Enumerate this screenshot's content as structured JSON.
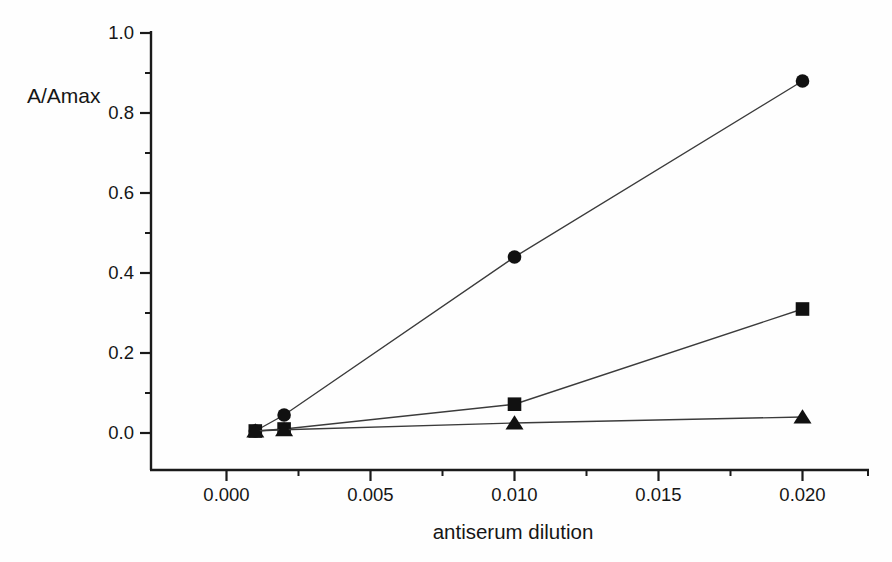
{
  "chart_data": {
    "type": "line",
    "title": "",
    "xlabel": "antiserum dilution",
    "ylabel": "A/Amax",
    "xlim": [
      -0.0026,
      0.0223
    ],
    "ylim": [
      -0.093,
      1.0
    ],
    "xticks": [
      0.0,
      0.005,
      0.01,
      0.015,
      0.02
    ],
    "xtick_labels": [
      "0.000",
      "0.005",
      "0.010",
      "0.015",
      "0.020"
    ],
    "x_minor_ticks": [
      0.0025,
      0.0075,
      0.0125,
      0.0175,
      0.0223
    ],
    "yticks": [
      0.0,
      0.2,
      0.4,
      0.6,
      0.8,
      1.0
    ],
    "ytick_labels": [
      "0.0",
      "0.2",
      "0.4",
      "0.6",
      "0.8",
      "1.0"
    ],
    "y_minor_ticks": [
      0.1,
      0.3,
      0.5,
      0.7,
      0.9
    ],
    "grid": false,
    "legend": "none",
    "x": [
      0.001,
      0.002,
      0.01,
      0.02
    ],
    "series": [
      {
        "name": "filled-circle-series",
        "marker": "circle",
        "values": [
          0.005,
          0.045,
          0.44,
          0.88
        ]
      },
      {
        "name": "filled-square-series",
        "marker": "square",
        "values": [
          0.005,
          0.01,
          0.072,
          0.31
        ]
      },
      {
        "name": "filled-triangle-series",
        "marker": "triangle",
        "values": [
          0.005,
          0.008,
          0.025,
          0.04
        ]
      }
    ],
    "colors": {
      "axis": "#1a1a1a",
      "line": "#3b3b3b",
      "marker": "#111111",
      "text": "#161616",
      "background": "#fefefe"
    }
  }
}
